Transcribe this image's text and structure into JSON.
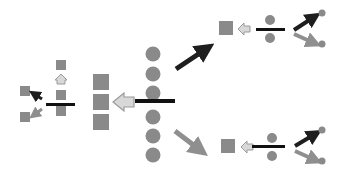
{
  "diagram": {
    "title": "",
    "colors": {
      "shape_fill": "#8a8a8a",
      "bar": "#111111",
      "dark_arrow": "#1e1e1e",
      "gray_arrow": "#8f8f8f",
      "hollow_arrow_fill": "#d8d8d8",
      "hollow_arrow_stroke": "#9a9a9a",
      "background": "#ffffff"
    },
    "nodes": {
      "center_circles": {
        "count": 6,
        "shape": "circle"
      },
      "center_squares": {
        "count": 3,
        "shape": "square"
      },
      "left_unit": {
        "squares": 4,
        "shape": "square"
      },
      "top_right_unit": {
        "circles": 3,
        "squares": 1
      },
      "bottom_right_unit": {
        "circles": 3,
        "squares": 1
      }
    },
    "arrows": [
      {
        "from": "center_circles",
        "to": "center_squares",
        "style": "hollow"
      },
      {
        "from": "center_circles",
        "to": "top_right_unit",
        "style": "dark"
      },
      {
        "from": "center_circles",
        "to": "bottom_right_unit",
        "style": "gray"
      },
      {
        "from": "left_unit_bar",
        "to": "left_top_square",
        "style": "hollow"
      },
      {
        "from": "left_unit_bar",
        "to": "left_upper_square",
        "style": "dark"
      },
      {
        "from": "left_unit_bar",
        "to": "left_lower_square",
        "style": "gray"
      },
      {
        "from": "top_right_bar",
        "to": "top_right_square",
        "style": "hollow"
      },
      {
        "from": "bottom_right_bar",
        "to": "bottom_right_square",
        "style": "hollow"
      }
    ]
  }
}
